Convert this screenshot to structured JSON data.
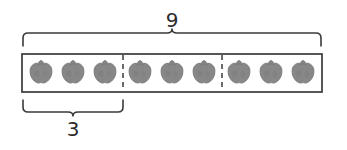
{
  "diagram": {
    "total_label": "9",
    "group_label": "3",
    "total_count": 9,
    "group_count": 3,
    "groups_of": 3,
    "item_icon": "apple-icon",
    "colors": {
      "stroke": "#3a3a3a",
      "item_fill": "#878787",
      "item_stroke": "#6f6f6f",
      "text": "#2b2b2b",
      "background": "#ffffff"
    },
    "box": {
      "x": 22,
      "y": 54,
      "width": 300,
      "height": 38
    },
    "dividers": [
      123,
      222
    ],
    "top_brace": {
      "x1": 22,
      "x2": 322,
      "y": 46,
      "tip_x": 172
    },
    "bottom_brace": {
      "x1": 22,
      "x2": 124,
      "y": 100,
      "tip_x": 73
    },
    "items": [
      {
        "cx": 41,
        "cy": 72,
        "group": 1
      },
      {
        "cx": 73,
        "cy": 72,
        "group": 1
      },
      {
        "cx": 105,
        "cy": 72,
        "group": 1
      },
      {
        "cx": 140,
        "cy": 72,
        "group": 2
      },
      {
        "cx": 172,
        "cy": 72,
        "group": 2
      },
      {
        "cx": 204,
        "cy": 72,
        "group": 2
      },
      {
        "cx": 239,
        "cy": 72,
        "group": 3
      },
      {
        "cx": 271,
        "cy": 72,
        "group": 3
      },
      {
        "cx": 303,
        "cy": 72,
        "group": 3
      }
    ],
    "total_label_pos": {
      "x": 172,
      "y": 21
    },
    "group_label_pos": {
      "x": 73,
      "y": 128
    }
  }
}
